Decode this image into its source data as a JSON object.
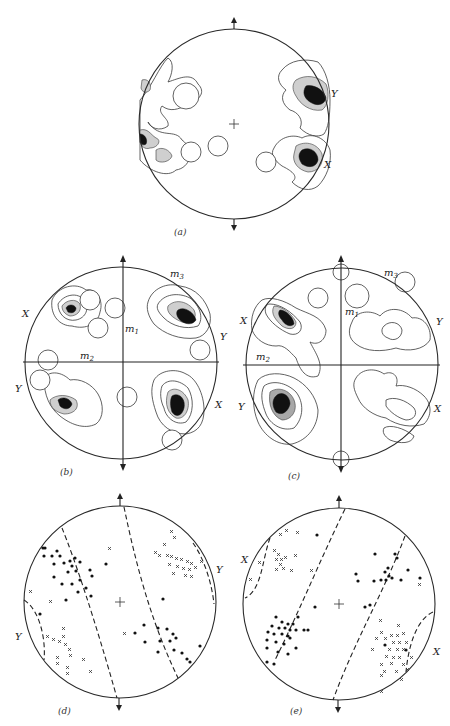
{
  "figure": {
    "panels": [
      {
        "id": "a",
        "caption": "(a)",
        "labels": {
          "y_right": "Y",
          "x_right": "X"
        },
        "center_mark": "+"
      },
      {
        "id": "b",
        "caption": "(b)",
        "labels": {
          "m1": "m",
          "m1_sub": "1",
          "m2": "m",
          "m2_sub": "2",
          "m3": "m",
          "m3_sub": "3",
          "x_left": "X",
          "y_left": "Y",
          "y_right": "Y",
          "x_right": "X"
        }
      },
      {
        "id": "c",
        "caption": "(c)",
        "labels": {
          "m1": "m",
          "m1_sub": "1",
          "m2": "m",
          "m2_sub": "2",
          "m3": "m",
          "m3_sub": "3",
          "x_left": "X",
          "y_left": "Y",
          "y_right": "Y",
          "x_right": "X"
        }
      },
      {
        "id": "d",
        "caption": "(d)",
        "labels": {
          "y_right": "Y",
          "y_left": "Y"
        },
        "center_mark": "+"
      },
      {
        "id": "e",
        "caption": "(e)",
        "labels": {
          "x_left": "X",
          "x_right": "X"
        },
        "center_mark": "+"
      }
    ],
    "symbols": {
      "point_dot": "filled-dot",
      "point_cross": "x-mark"
    }
  }
}
